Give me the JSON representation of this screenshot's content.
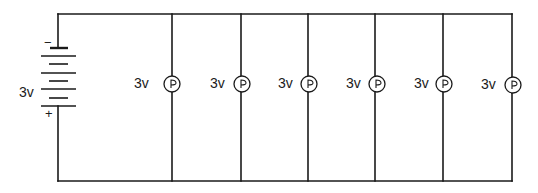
{
  "diagram": {
    "type": "parallel-circuit",
    "battery": {
      "label": "3v",
      "negative_sign": "−",
      "positive_sign": "+",
      "cells": 4
    },
    "bulbs": [
      {
        "label": "3v",
        "symbol": "lamp"
      },
      {
        "label": "3v",
        "symbol": "lamp"
      },
      {
        "label": "3v",
        "symbol": "lamp"
      },
      {
        "label": "3v",
        "symbol": "lamp"
      },
      {
        "label": "3v",
        "symbol": "lamp"
      },
      {
        "label": "3v",
        "symbol": "lamp"
      }
    ],
    "colors": {
      "ink": "#1a1a1a",
      "background": "#ffffff"
    }
  }
}
